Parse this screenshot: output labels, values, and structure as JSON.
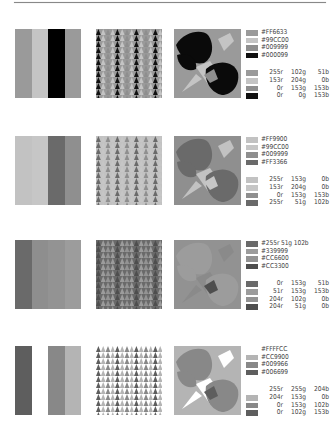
{
  "page": {
    "rule": true
  },
  "rows": [
    {
      "stripe_colors": [
        "#9a9a9a",
        "#c4c4c4",
        "#000000",
        "#9a9a9a"
      ],
      "gray": [
        "#9a9a9a",
        "#c4c4c4",
        "#8e8e8e",
        "#111111"
      ],
      "hex_labels": [
        "#FF6633",
        "#99CC00",
        "#009999",
        "#000099"
      ],
      "rgb_labels": [
        {
          "r": "255r",
          "g": "102g",
          "b": "51b"
        },
        {
          "r": "153r",
          "g": "204g",
          "b": "0b"
        },
        {
          "r": "0r",
          "g": "153g",
          "b": "153b"
        },
        {
          "r": "0r",
          "g": "0g",
          "b": "153b"
        }
      ],
      "motif": {
        "bg": "#9a9a9a",
        "leaf": "#0a0a0a",
        "light": "#c4c4c4",
        "band": "#8e8e8e"
      }
    },
    {
      "stripe_colors": [
        "#c2c2c2",
        "#c6c6c6",
        "#6a6a6a",
        "#8f8f8f"
      ],
      "gray": [
        "#c2c2c2",
        "#c6c6c6",
        "#8f8f8f",
        "#6a6a6a"
      ],
      "hex_labels": [
        "#FF9900",
        "#99CC00",
        "#009999",
        "#FF3366"
      ],
      "rgb_labels": [
        {
          "r": "255r",
          "g": "153g",
          "b": "0b"
        },
        {
          "r": "153r",
          "g": "204g",
          "b": "0b"
        },
        {
          "r": "0r",
          "g": "153g",
          "b": "153b"
        },
        {
          "r": "255r",
          "g": "51g",
          "b": "102b"
        }
      ],
      "motif": {
        "bg": "#8f8f8f",
        "leaf": "#6a6a6a",
        "light": "#c2c2c2",
        "band": "#c6c6c6"
      }
    },
    {
      "stripe_colors": [
        "#6a6a6a",
        "#8e8e8e",
        "#939393",
        "#9c9c9c"
      ],
      "gray": [
        "#6a6a6a",
        "#9c9c9c",
        "#939393",
        "#4e4e4e"
      ],
      "hex_labels": [
        "#255r 51g 102b",
        "#339999",
        "#CC6600",
        "#CC3300"
      ],
      "rgb_labels": [
        {
          "r": "0r",
          "g": "153g",
          "b": "51b"
        },
        {
          "r": "51r",
          "g": "153g",
          "b": "153b"
        },
        {
          "r": "204r",
          "g": "102g",
          "b": "0b"
        },
        {
          "r": "204r",
          "g": "51g",
          "b": "0b"
        }
      ],
      "motif": {
        "bg": "#929292",
        "leaf": "#9c9c9c",
        "light": "#8a8a8a",
        "band": "#4e4e4e"
      }
    },
    {
      "stripe_colors": [
        "#5e5e5e",
        "#ffffff",
        "#888888",
        "#b4b4b4"
      ],
      "gray": [
        null,
        "#b4b4b4",
        "#888888",
        "#5e5e5e"
      ],
      "hex_labels": [
        "#FFFFCC",
        "#CC9900",
        "#009966",
        "#006699"
      ],
      "rgb_labels": [
        {
          "r": "255r",
          "g": "255g",
          "b": "204b"
        },
        {
          "r": "204r",
          "g": "153g",
          "b": "0b"
        },
        {
          "r": "0r",
          "g": "153g",
          "b": "102b"
        },
        {
          "r": "0r",
          "g": "102g",
          "b": "153b"
        }
      ],
      "motif": {
        "bg": "#b4b4b4",
        "leaf": "#888888",
        "light": "#ffffff",
        "band": "#5e5e5e"
      }
    }
  ]
}
